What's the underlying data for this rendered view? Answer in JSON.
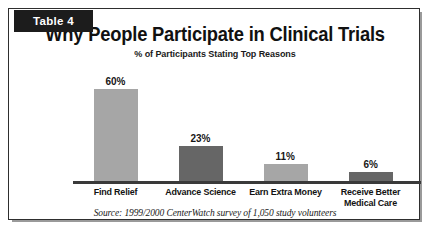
{
  "tab": {
    "label": "Table 4"
  },
  "source": {
    "text": "Source: 1999/2000 CenterWatch survey of 1,050 study volunteers"
  },
  "colors": {
    "bar_light": "#a6a6a6",
    "bar_dark": "#666666",
    "frame": "#2e2e2e",
    "tab_bg": "#1c1c1c",
    "axis": "#3a3a3a",
    "text": "#111111",
    "page_bg": "#ffffff"
  },
  "chart_data": {
    "type": "bar",
    "title": "Why People Participate in Clinical Trials",
    "subtitle": "% of Participants Stating Top Reasons",
    "categories": [
      "Find Relief",
      "Advance Science",
      "Earn Extra Money",
      "Receive Better Medical Care"
    ],
    "category_lines": [
      [
        "Find Relief"
      ],
      [
        "Advance Science"
      ],
      [
        "Earn Extra Money"
      ],
      [
        "Receive Better",
        "Medical Care"
      ]
    ],
    "values": [
      60,
      23,
      11,
      6
    ],
    "value_labels": [
      "60%",
      "23%",
      "11%",
      "6%"
    ],
    "bar_colors": [
      "#a6a6a6",
      "#666666",
      "#a6a6a6",
      "#666666"
    ],
    "xlabel": "",
    "ylabel": "% of Participants",
    "ylim": [
      0,
      72
    ],
    "grid": false,
    "legend": "none"
  }
}
